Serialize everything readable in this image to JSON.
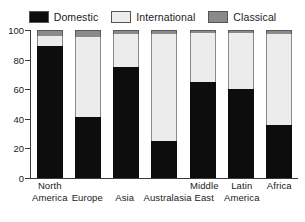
{
  "chart_data": {
    "type": "bar",
    "subtype": "stacked-bar-100",
    "title": "",
    "subtitle": "",
    "xlabel": "",
    "ylabel": "",
    "ylim": [
      0,
      100
    ],
    "yticks": [
      0,
      20,
      40,
      60,
      80,
      100
    ],
    "grid": false,
    "legend_position": "top",
    "categories": [
      "North America",
      "Europe",
      "Asia",
      "Australasia",
      "Middle East",
      "Latin America",
      "Africa"
    ],
    "series": [
      {
        "name": "Domestic",
        "color": "#0d0d0d",
        "values": [
          89,
          41,
          75,
          25,
          65,
          60,
          36
        ]
      },
      {
        "name": "International",
        "color": "#ececec",
        "values": [
          7,
          54,
          22,
          72,
          33,
          38,
          61
        ]
      },
      {
        "name": "Classical",
        "color": "#8a8a8a",
        "values": [
          4,
          5,
          3,
          3,
          2,
          2,
          3
        ]
      }
    ]
  },
  "legend": {
    "entries": [
      {
        "label": "Domestic",
        "swatch": "#0d0d0d"
      },
      {
        "label": "International",
        "swatch": "#ececec"
      },
      {
        "label": "Classical",
        "swatch": "#8a8a8a"
      }
    ]
  },
  "axis": {
    "y_tick_labels": [
      "100",
      "80",
      "60",
      "40",
      "20",
      "0"
    ]
  },
  "x_axis": {
    "labels": [
      {
        "line1": "North",
        "line2": "America"
      },
      {
        "line1": "",
        "line2": "Europe"
      },
      {
        "line1": "",
        "line2": "Asia"
      },
      {
        "line1": "",
        "line2": "Australasia"
      },
      {
        "line1": "Middle",
        "line2": "East"
      },
      {
        "line1": "Latin",
        "line2": "America"
      },
      {
        "line1": "Africa",
        "line2": ""
      }
    ]
  }
}
